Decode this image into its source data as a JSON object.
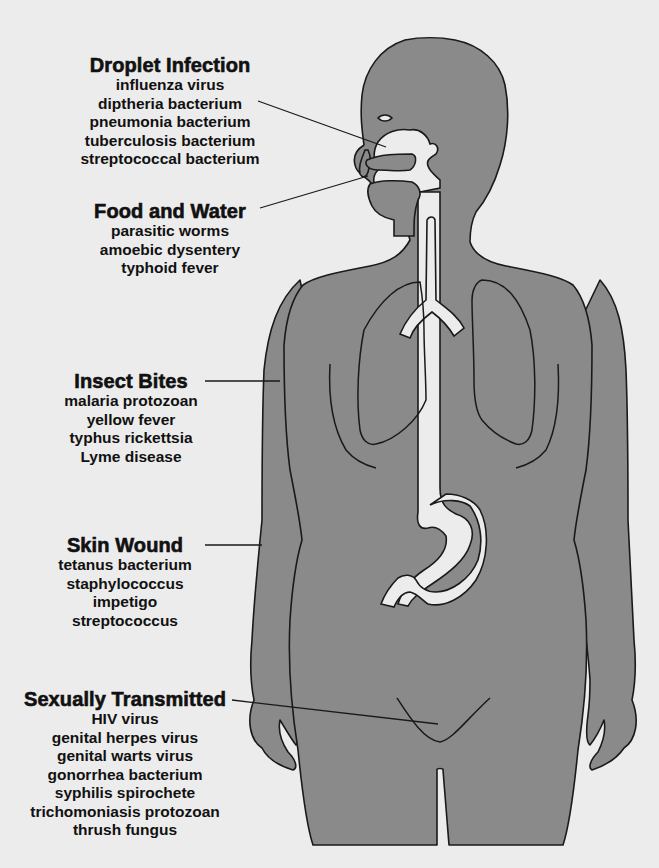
{
  "diagram": {
    "colors": {
      "background": "#ececec",
      "body_fill": "#8a8a8a",
      "outline": "#1a1a1a",
      "cavity_fill": "#ececec",
      "text": "#111111"
    },
    "groups": [
      {
        "title": "Droplet Infection",
        "items": [
          "influenza virus",
          "diptheria bacterium",
          "pneumonia bacterium",
          "tuberculosis bacterium",
          "streptococcal bacterium"
        ],
        "points_to": "nasal cavity"
      },
      {
        "title": "Food and Water",
        "items": [
          "parasitic worms",
          "amoebic dysentery",
          "typhoid fever"
        ],
        "points_to": "mouth"
      },
      {
        "title": "Insect Bites",
        "items": [
          "malaria protozoan",
          "yellow fever",
          "typhus rickettsia",
          "Lyme disease"
        ],
        "points_to": "skin of arm"
      },
      {
        "title": "Skin Wound",
        "items": [
          "tetanus bacterium",
          "staphylococcus",
          "impetigo streptococcus"
        ],
        "points_to": "skin of arm"
      },
      {
        "title": "Sexually Transmitted",
        "items": [
          "HIV virus",
          "genital herpes virus",
          "genital warts virus",
          "gonorrhea bacterium",
          "syphilis spirochete",
          "trichomoniasis protozoan",
          "thrush fungus"
        ],
        "points_to": "genital region"
      }
    ]
  }
}
